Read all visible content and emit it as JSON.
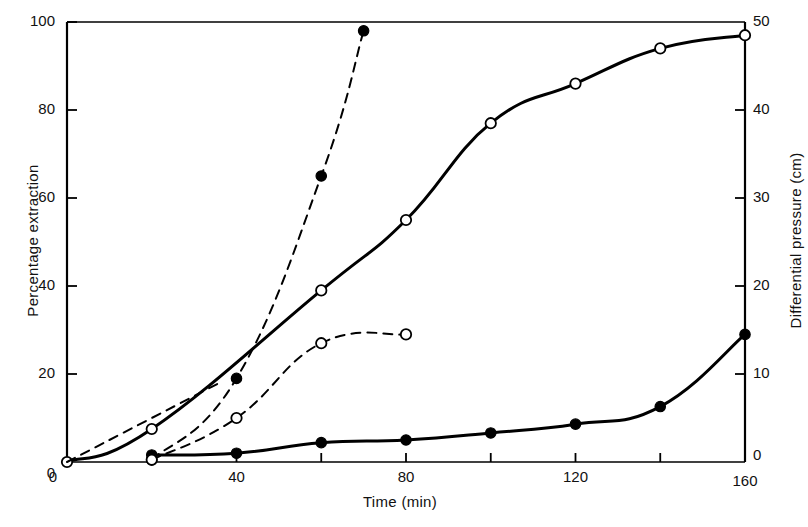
{
  "chart_data": {
    "type": "line",
    "title": "",
    "xlabel": "Time  (min)",
    "ylabel_left": "Percentage extraction",
    "ylabel_right": "Differential pressure  (cm)",
    "xlim": [
      0,
      160
    ],
    "ylim_left": [
      0,
      100
    ],
    "ylim_right": [
      0,
      50
    ],
    "grid": false,
    "legend_position": "none",
    "xticks_major": [
      0,
      40,
      80,
      120,
      160
    ],
    "xticks_minor": [
      20,
      60,
      100,
      140
    ],
    "xtick_labels": [
      "0",
      "40",
      "80",
      "120",
      "160"
    ],
    "yticks_left": [
      0,
      20,
      40,
      60,
      80,
      100
    ],
    "ytick_labels_left": [
      "0",
      "20",
      "40",
      "60",
      "80",
      "100"
    ],
    "yticks_right": [
      0,
      10,
      20,
      30,
      40,
      50
    ],
    "ytick_labels_right": [
      "0",
      "10",
      "20",
      "30",
      "40",
      "50"
    ],
    "series": [
      {
        "name": "Percentage extraction (solid, open circles)",
        "axis": "left",
        "line_style": "solid",
        "line_width": 3,
        "marker": "open-circle",
        "color": "#000000",
        "x": [
          0,
          20,
          60,
          80,
          100,
          120,
          140,
          160
        ],
        "y": [
          0,
          7.5,
          39,
          55,
          77,
          86,
          94,
          97
        ]
      },
      {
        "name": "Differential pressure (solid, filled circles)",
        "axis": "right",
        "line_style": "solid",
        "line_width": 3,
        "marker": "filled-circle",
        "color": "#000000",
        "x": [
          20,
          40,
          60,
          80,
          100,
          120,
          140,
          160
        ],
        "y": [
          0.8,
          1.0,
          2.2,
          2.5,
          3.3,
          4.3,
          6.3,
          14.5
        ]
      },
      {
        "name": "Percentage extraction (dashed, filled circles)",
        "axis": "left",
        "line_style": "dashed",
        "line_width": 2,
        "marker": "filled-circle",
        "color": "#000000",
        "x": [
          20,
          40,
          60,
          70
        ],
        "y": [
          0.5,
          19,
          65,
          98
        ]
      },
      {
        "name": "Percentage extraction (dashed, open circles)",
        "axis": "left",
        "line_style": "dashed",
        "line_width": 2,
        "marker": "open-circle",
        "color": "#000000",
        "x": [
          20,
          40,
          60,
          80
        ],
        "y": [
          0.5,
          10,
          27,
          29
        ]
      },
      {
        "name": "Differential pressure early trend (dashed)",
        "axis": "left",
        "line_style": "dashed",
        "line_width": 2,
        "marker": "none",
        "color": "#000000",
        "x": [
          0,
          20,
          36
        ],
        "y": [
          0,
          10,
          18
        ]
      }
    ]
  },
  "axes": {
    "left_title": "Percentage extraction",
    "right_title": "Differential pressure  (cm)",
    "bottom_title": "Time  (min)"
  },
  "colors": {
    "ink": "#000000",
    "background": "#ffffff"
  }
}
